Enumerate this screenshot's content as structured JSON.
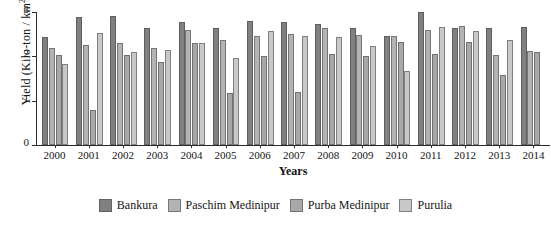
{
  "chart_data": {
    "type": "bar",
    "title": "",
    "xlabel": "Years",
    "ylabel": "Yield (Kilo-ton / km2)",
    "ylabel_base": "Yield (Kilo-ton / km",
    "ylabel_sup": "2",
    "ylabel_tail": ")",
    "ylim": [
      0,
      3
    ],
    "yticks": [
      0,
      1,
      2,
      3
    ],
    "ytick_labels": [
      "0",
      "1",
      "2",
      "3"
    ],
    "grid": false,
    "legend_position": "bottom",
    "categories": [
      "2000",
      "2001",
      "2002",
      "2003",
      "2004",
      "2005",
      "2006",
      "2007",
      "2008",
      "2009",
      "2010",
      "2011",
      "2012",
      "2013",
      "2014"
    ],
    "series": [
      {
        "name": "Bankura",
        "color": "#817f7f",
        "values": [
          2.43,
          2.89,
          2.91,
          2.65,
          2.77,
          2.65,
          2.79,
          2.77,
          2.74,
          2.64,
          2.47,
          3.01,
          2.65,
          2.64,
          2.67
        ]
      },
      {
        "name": "Paschim Medinipur",
        "color": "#b4b2b2",
        "values": [
          2.19,
          2.25,
          2.3,
          2.19,
          2.59,
          2.38,
          2.45,
          2.5,
          2.63,
          2.48,
          2.47,
          2.6,
          2.68,
          2.04,
          2.12
        ]
      },
      {
        "name": "Purba Medinipur",
        "color": "#a9a7a7",
        "values": [
          2.02,
          0.79,
          2.04,
          1.88,
          2.3,
          1.18,
          2.0,
          1.2,
          2.06,
          2.01,
          2.33,
          2.05,
          2.32,
          1.58,
          2.09
        ]
      },
      {
        "name": "Purulia",
        "color": "#c9c7c7",
        "values": [
          1.82,
          2.53,
          2.09,
          2.15,
          2.29,
          1.96,
          2.58,
          2.45,
          2.43,
          2.23,
          1.66,
          2.67,
          2.57,
          2.38,
          null
        ]
      }
    ]
  },
  "legend": {
    "items": [
      {
        "label": "Bankura"
      },
      {
        "label": "Paschim Medinipur"
      },
      {
        "label": "Purba Medinipur"
      },
      {
        "label": "Purulia"
      }
    ]
  }
}
